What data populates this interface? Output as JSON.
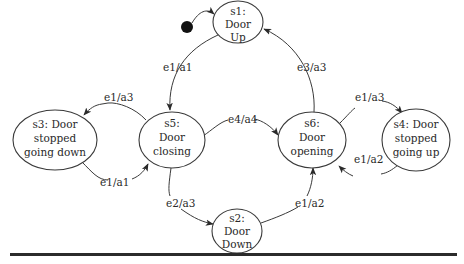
{
  "diagram": {
    "type": "state-machine",
    "initial": "s1",
    "states": [
      {
        "id": "s1",
        "lines": [
          "s1:",
          "Door",
          "Up"
        ]
      },
      {
        "id": "s2",
        "lines": [
          "s2:",
          "Door",
          "Down"
        ]
      },
      {
        "id": "s3",
        "lines": [
          "s3: Door",
          "stopped",
          "going down"
        ]
      },
      {
        "id": "s4",
        "lines": [
          "s4: Door",
          "stopped",
          "going up"
        ]
      },
      {
        "id": "s5",
        "lines": [
          "s5:",
          "Door",
          "closing"
        ]
      },
      {
        "id": "s6",
        "lines": [
          "s6:",
          "Door",
          "opening"
        ]
      }
    ],
    "transitions": [
      {
        "from": "s1",
        "to": "s5",
        "label": "e1/a1"
      },
      {
        "from": "s5",
        "to": "s3",
        "label": "e1/a3"
      },
      {
        "from": "s3",
        "to": "s5",
        "label": "e1/a1"
      },
      {
        "from": "s5",
        "to": "s6",
        "label": "e4/a4"
      },
      {
        "from": "s5",
        "to": "s2",
        "label": "e2/a3"
      },
      {
        "from": "s2",
        "to": "s6",
        "label": "e1/a2"
      },
      {
        "from": "s6",
        "to": "s1",
        "label": "e3/a3"
      },
      {
        "from": "s6",
        "to": "s4",
        "label": "e1/a3"
      },
      {
        "from": "s4",
        "to": "s6",
        "label": "e1/a2"
      }
    ],
    "colors": {
      "stroke": "#3a3a3a",
      "text": "#2a2a2a",
      "initial_dot": "#111111",
      "rule": "#2b2b2b"
    }
  }
}
